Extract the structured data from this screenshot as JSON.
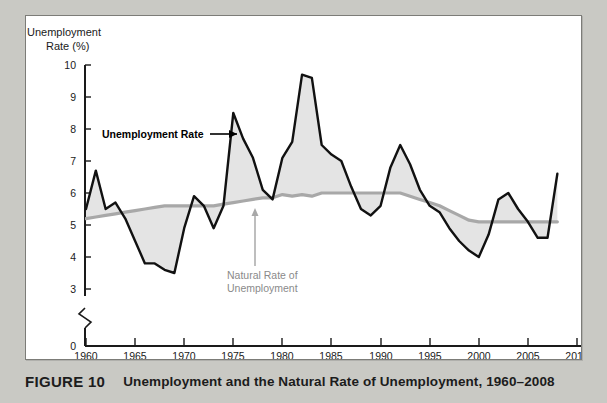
{
  "figure": {
    "number_label": "FIGURE 10",
    "title": "Unemployment and the Natural Rate of Unemployment, 1960–2008"
  },
  "chart_data": {
    "type": "line",
    "title": "Unemployment and the Natural Rate of Unemployment, 1960–2008",
    "xlabel": "",
    "ylabel": "Unemployment Rate (%)",
    "ylabel_line1": "Unemployment",
    "ylabel_line2": "Rate (%)",
    "xlim": [
      1960,
      2010
    ],
    "ylim": [
      0,
      10
    ],
    "y_axis_break": true,
    "y_axis_break_note": "axis broken between 0 and 3",
    "grid": false,
    "legend_position": "inline-annotations",
    "xticks": [
      1960,
      1965,
      1970,
      1975,
      1980,
      1985,
      1990,
      1995,
      2000,
      2005,
      2010
    ],
    "xtick_labels": [
      "1960",
      "1965",
      "1970",
      "1975",
      "1980",
      "1985",
      "1990",
      "1995",
      "2000",
      "2005",
      "2010"
    ],
    "yticks": [
      0,
      3,
      4,
      5,
      6,
      7,
      8,
      9,
      10
    ],
    "ytick_labels": [
      "0",
      "3",
      "4",
      "5",
      "6",
      "7",
      "8",
      "9",
      "10"
    ],
    "x": [
      1960,
      1961,
      1962,
      1963,
      1964,
      1965,
      1966,
      1967,
      1968,
      1969,
      1970,
      1971,
      1972,
      1973,
      1974,
      1975,
      1976,
      1977,
      1978,
      1979,
      1980,
      1981,
      1982,
      1983,
      1984,
      1985,
      1986,
      1987,
      1988,
      1989,
      1990,
      1991,
      1992,
      1993,
      1994,
      1995,
      1996,
      1997,
      1998,
      1999,
      2000,
      2001,
      2002,
      2003,
      2004,
      2005,
      2006,
      2007,
      2008
    ],
    "series": [
      {
        "name": "Unemployment Rate",
        "color": "#111111",
        "style": "solid-black-thick",
        "values": [
          5.5,
          6.7,
          5.5,
          5.7,
          5.2,
          4.5,
          3.8,
          3.8,
          3.6,
          3.5,
          4.9,
          5.9,
          5.6,
          4.9,
          5.6,
          8.5,
          7.7,
          7.1,
          6.1,
          5.8,
          7.1,
          7.6,
          9.7,
          9.6,
          7.5,
          7.2,
          7.0,
          6.2,
          5.5,
          5.3,
          5.6,
          6.8,
          7.5,
          6.9,
          6.1,
          5.6,
          5.4,
          4.9,
          4.5,
          4.2,
          4.0,
          4.7,
          5.8,
          6.0,
          5.5,
          5.1,
          4.6,
          4.6,
          6.6
        ]
      },
      {
        "name": "Natural Rate of Unemployment",
        "color": "#a8a8a8",
        "style": "solid-gray-thick",
        "values": [
          5.2,
          5.25,
          5.3,
          5.35,
          5.4,
          5.45,
          5.5,
          5.55,
          5.6,
          5.6,
          5.6,
          5.6,
          5.6,
          5.6,
          5.65,
          5.7,
          5.75,
          5.8,
          5.85,
          5.85,
          5.95,
          5.9,
          5.95,
          5.9,
          6.0,
          6.0,
          6.0,
          6.0,
          6.0,
          6.0,
          6.0,
          6.0,
          6.0,
          5.9,
          5.8,
          5.7,
          5.6,
          5.45,
          5.3,
          5.15,
          5.1,
          5.1,
          5.1,
          5.1,
          5.1,
          5.1,
          5.1,
          5.1,
          5.1
        ]
      }
    ],
    "annotations": [
      {
        "name": "unemployment-rate-annotation",
        "text": "Unemployment Rate",
        "color": "#000000",
        "arrow": "right",
        "points_to_year": 1975
      },
      {
        "name": "natural-rate-annotation",
        "text_line1": "Natural Rate of",
        "text_line2": "Unemployment",
        "color": "#8a8a8a",
        "arrow": "up",
        "points_to_year": 1978
      }
    ],
    "shading_note": "Light gray fill between the unemployment rate line and the natural rate line"
  }
}
